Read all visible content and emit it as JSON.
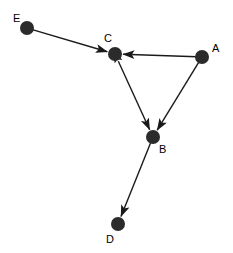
{
  "graph": {
    "type": "directed-node-link-diagram",
    "canvas": {
      "width": 233,
      "height": 253,
      "background": "#ffffff"
    },
    "style": {
      "node_color": "#2b2b2b",
      "node_radius": 7,
      "edge_color": "#1a1a1a",
      "edge_width": 1.4,
      "label_color": "#000000",
      "label_font_size": 11
    },
    "nodes": [
      {
        "id": "E",
        "label": "E",
        "x": 27,
        "y": 28,
        "label_x": 13,
        "label_y": 22
      },
      {
        "id": "C",
        "label": "C",
        "x": 115,
        "y": 54,
        "label_x": 104,
        "label_y": 42
      },
      {
        "id": "A",
        "label": "A",
        "x": 202,
        "y": 57,
        "label_x": 212,
        "label_y": 52
      },
      {
        "id": "B",
        "label": "B",
        "x": 153,
        "y": 137,
        "label_x": 159,
        "label_y": 153
      },
      {
        "id": "D",
        "label": "D",
        "x": 118,
        "y": 224,
        "label_x": 106,
        "label_y": 243
      }
    ],
    "edges": [
      {
        "id": "E-C",
        "from": "E",
        "to": "C",
        "arrow_at_target": true,
        "arrow_at_source": false
      },
      {
        "id": "A-C",
        "from": "A",
        "to": "C",
        "arrow_at_target": true,
        "arrow_at_source": false
      },
      {
        "id": "A-B",
        "from": "A",
        "to": "B",
        "arrow_at_target": true,
        "arrow_at_source": false
      },
      {
        "id": "C-B",
        "from": "C",
        "to": "B",
        "arrow_at_target": true,
        "arrow_at_source": true
      },
      {
        "id": "B-D",
        "from": "B",
        "to": "D",
        "arrow_at_target": true,
        "arrow_at_source": false
      }
    ]
  }
}
